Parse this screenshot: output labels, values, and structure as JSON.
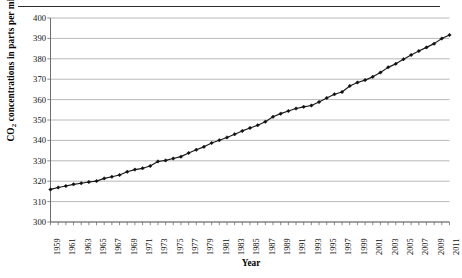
{
  "chart_data": {
    "type": "line",
    "title": "",
    "xlabel": "Year",
    "ylabel": "CO2 concentrations in parts per million",
    "ylabel_prefix": "CO",
    "ylabel_sub": "2",
    "ylabel_suffix": " concentrations in parts per million",
    "ylim": [
      300,
      400
    ],
    "ytick_step": 10,
    "yticks": [
      "300",
      "310",
      "320",
      "330",
      "340",
      "350",
      "360",
      "370",
      "380",
      "390",
      "400"
    ],
    "xlim": [
      1959,
      2011
    ],
    "xtick_step": 2,
    "xticks": [
      "1959",
      "1961",
      "1963",
      "1965",
      "1967",
      "1969",
      "1971",
      "1973",
      "1975",
      "1977",
      "1979",
      "1981",
      "1983",
      "1985",
      "1987",
      "1989",
      "1991",
      "1993",
      "1995",
      "1997",
      "1999",
      "2001",
      "2003",
      "2005",
      "2007",
      "2009",
      "2011"
    ],
    "grid": "horizontal",
    "legend": "none",
    "marker": "diamond",
    "line_color": "#1a1a1a",
    "marker_color": "#111111",
    "grid_color": "#a6a6a6",
    "axis_color": "#808080",
    "series": [
      {
        "name": "Atmospheric CO2 concentration",
        "x": [
          1959,
          1960,
          1961,
          1962,
          1963,
          1964,
          1965,
          1966,
          1967,
          1968,
          1969,
          1970,
          1971,
          1972,
          1973,
          1974,
          1975,
          1976,
          1977,
          1978,
          1979,
          1980,
          1981,
          1982,
          1983,
          1984,
          1985,
          1986,
          1987,
          1988,
          1989,
          1990,
          1991,
          1992,
          1993,
          1994,
          1995,
          1996,
          1997,
          1998,
          1999,
          2000,
          2001,
          2002,
          2003,
          2004,
          2005,
          2006,
          2007,
          2008,
          2009,
          2010,
          2011
        ],
        "values": [
          315.97,
          316.91,
          317.64,
          318.45,
          318.99,
          319.62,
          320.04,
          321.38,
          322.16,
          323.04,
          324.62,
          325.68,
          326.32,
          327.45,
          329.68,
          330.18,
          331.11,
          332.04,
          333.83,
          335.4,
          336.84,
          338.75,
          340.11,
          341.45,
          343.05,
          344.65,
          346.12,
          347.42,
          349.19,
          351.57,
          353.12,
          354.39,
          355.61,
          356.45,
          357.1,
          358.83,
          360.82,
          362.61,
          363.73,
          366.7,
          368.38,
          369.55,
          371.14,
          373.28,
          375.8,
          377.52,
          379.8,
          381.9,
          383.79,
          385.6,
          387.43,
          389.9,
          391.65
        ]
      }
    ]
  }
}
